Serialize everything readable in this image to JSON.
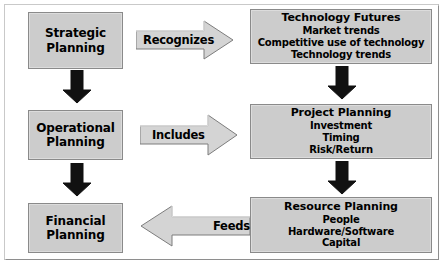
{
  "diagram": {
    "colors": {
      "node_fill": "#cccccc",
      "node_border": "#8a8a8a",
      "arrow_fill": "#d4d4d4",
      "arrow_border": "#808080",
      "solid_arrow": "#111111",
      "background": "#ffffff",
      "frame_border": "#b6b6b6"
    },
    "nodes": [
      {
        "id": "strategic-planning",
        "title": "Strategic",
        "title2": "Planning",
        "lines": []
      },
      {
        "id": "operational-planning",
        "title": "Operational",
        "title2": "Planning",
        "lines": []
      },
      {
        "id": "financial-planning",
        "title": "Financial",
        "title2": "Planning",
        "lines": []
      },
      {
        "id": "technology-futures",
        "title": "Technology Futures",
        "lines": [
          "Market trends",
          "Competitive use of technology",
          "Technology trends"
        ]
      },
      {
        "id": "project-planning",
        "title": "Project Planning",
        "lines": [
          "Investment",
          "Timing",
          "Risk/Return"
        ]
      },
      {
        "id": "resource-planning",
        "title": "Resource Planning",
        "lines": [
          "People",
          "Hardware/Software",
          "Capital"
        ]
      }
    ],
    "connectors": [
      {
        "id": "recognizes",
        "label": "Recognizes",
        "direction": "right",
        "from": "strategic-planning",
        "to": "technology-futures"
      },
      {
        "id": "includes",
        "label": "Includes",
        "direction": "right",
        "from": "operational-planning",
        "to": "project-planning"
      },
      {
        "id": "feeds",
        "label": "Feeds",
        "direction": "left",
        "from": "resource-planning",
        "to": "financial-planning"
      },
      {
        "id": "strategic-to-operational",
        "label": "",
        "direction": "down",
        "from": "strategic-planning",
        "to": "operational-planning"
      },
      {
        "id": "operational-to-financial",
        "label": "",
        "direction": "down",
        "from": "operational-planning",
        "to": "financial-planning"
      },
      {
        "id": "technology-to-project",
        "label": "",
        "direction": "down",
        "from": "technology-futures",
        "to": "project-planning"
      },
      {
        "id": "project-to-resource",
        "label": "",
        "direction": "down",
        "from": "project-planning",
        "to": "resource-planning"
      }
    ]
  }
}
